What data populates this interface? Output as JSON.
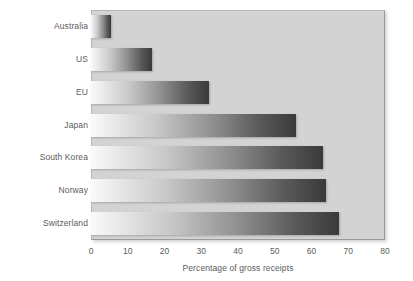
{
  "chart_data": {
    "type": "bar",
    "orientation": "horizontal",
    "title": "",
    "subtitle": "",
    "xlabel": "Percentage of gross receipts",
    "ylabel": "",
    "categories": [
      "Australia",
      "US",
      "EU",
      "Japan",
      "South Korea",
      "Norway",
      "Switzerland"
    ],
    "values": [
      5.5,
      16.5,
      32,
      55.7,
      63,
      64,
      67.4
    ],
    "series": [
      {
        "name": "Percentage of gross receipts",
        "values": [
          5.5,
          16.5,
          32,
          55.7,
          63,
          64,
          67.4
        ]
      }
    ],
    "xlim": [
      0,
      80
    ],
    "xticks": [
      0,
      10,
      20,
      30,
      40,
      50,
      60,
      70,
      80
    ],
    "xticklabels": [
      "0",
      "10",
      "20",
      "30",
      "40",
      "50",
      "60",
      "70",
      "80"
    ],
    "grid": false,
    "legend": false,
    "legend_position": "none",
    "colors": {
      "plot_background": "#d3d3d3",
      "figure_background": "#ffffff",
      "bar_gradient_start": "#fafafa",
      "bar_gradient_end": "#3a3a3a",
      "text": "#5c5c5c",
      "plot_border": "#9a9a9a"
    }
  },
  "axis": {
    "x_title": "Percentage of gross receipts",
    "ticks": [
      "0",
      "10",
      "20",
      "30",
      "40",
      "50",
      "60",
      "70",
      "80"
    ]
  },
  "categories": [
    {
      "label": "Australia"
    },
    {
      "label": "US"
    },
    {
      "label": "EU"
    },
    {
      "label": "Japan"
    },
    {
      "label": "South Korea"
    },
    {
      "label": "Norway"
    },
    {
      "label": "Switzerland"
    }
  ]
}
